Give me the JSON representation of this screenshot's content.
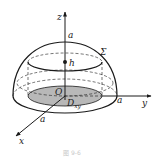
{
  "figure": {
    "labels": {
      "z_axis": "z",
      "y_axis": "y",
      "x_axis": "x",
      "origin": "O",
      "top_radius": "a",
      "y_radius": "a",
      "x_radius": "a",
      "surface": "Σ",
      "height": "h",
      "region_main": "D",
      "region_sub": "xy"
    },
    "caption": "图 9-6",
    "colors": {
      "stroke": "#1a1a1a",
      "disk_fill": "#b8b8b8",
      "caption": "#c8c8c8"
    }
  }
}
